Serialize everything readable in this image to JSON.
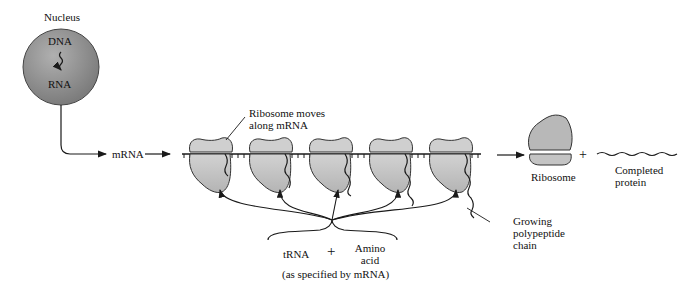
{
  "labels": {
    "nucleus": "Nucleus",
    "dna": "DNA",
    "rna": "RNA",
    "mrna": "mRNA",
    "ribosome_moves_1": "Ribosome moves",
    "ribosome_moves_2": "along mRNA",
    "ribosome": "Ribosome",
    "plus_right": "+",
    "completed_1": "Completed",
    "completed_2": "protein",
    "growing_1": "Growing",
    "growing_2": "polypeptide",
    "growing_3": "chain",
    "trna": "tRNA",
    "plus_bottom": "+",
    "amino_1": "Amino",
    "amino_2": "acid",
    "specified": "(as specified by mRNA)"
  },
  "colors": {
    "nucleus_fill": "#8e8e8e",
    "ribosome_fill": "#c4c4c4",
    "line": "#1a1a1a"
  },
  "ribosome_count": 5
}
